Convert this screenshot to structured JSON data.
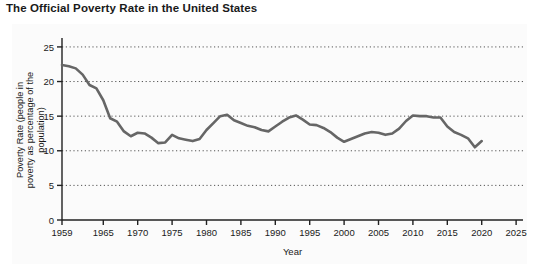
{
  "title": "The Official Poverty Rate in the United States",
  "colors": {
    "line": "#666666",
    "axis": "#222222",
    "grid": "#555555",
    "text": "#1a1a1a",
    "panel": "#fbfbfb",
    "background": "#ffffff"
  },
  "chart_data": {
    "type": "line",
    "title": "The Official Poverty Rate in the United States",
    "xlabel": "Year",
    "ylabel": "Poverty Rate (people in poverty as percentage of the population)",
    "xlim": [
      1959,
      2026
    ],
    "ylim": [
      0,
      26
    ],
    "xticks": [
      1959,
      1965,
      1970,
      1975,
      1980,
      1985,
      1990,
      1995,
      2000,
      2005,
      2010,
      2015,
      2020,
      2025
    ],
    "xtick_labels": [
      "1959",
      "1965",
      "1970",
      "1975",
      "1980",
      "1985",
      "1990",
      "1995",
      "2000",
      "2005",
      "2010",
      "2015",
      "2020",
      "2025"
    ],
    "yticks": [
      0,
      5,
      10,
      15,
      20,
      25
    ],
    "ytick_labels": [
      "0",
      "5",
      "10",
      "15",
      "20",
      "25"
    ],
    "grid": true,
    "grid_style": "dotted",
    "grid_axis": "y",
    "legend": false,
    "series": [
      {
        "name": "Official poverty rate",
        "x": [
          1959,
          1960,
          1961,
          1962,
          1963,
          1964,
          1965,
          1966,
          1967,
          1968,
          1969,
          1970,
          1971,
          1972,
          1973,
          1974,
          1975,
          1976,
          1977,
          1978,
          1979,
          1980,
          1981,
          1982,
          1983,
          1984,
          1985,
          1986,
          1987,
          1988,
          1989,
          1990,
          1991,
          1992,
          1993,
          1994,
          1995,
          1996,
          1997,
          1998,
          1999,
          2000,
          2001,
          2002,
          2003,
          2004,
          2005,
          2006,
          2007,
          2008,
          2009,
          2010,
          2011,
          2012,
          2013,
          2014,
          2015,
          2016,
          2017,
          2018,
          2019,
          2020
        ],
        "values": [
          22.4,
          22.2,
          21.9,
          21.0,
          19.5,
          19.0,
          17.3,
          14.7,
          14.2,
          12.8,
          12.1,
          12.6,
          12.5,
          11.9,
          11.1,
          11.2,
          12.3,
          11.8,
          11.6,
          11.4,
          11.7,
          13.0,
          14.0,
          15.0,
          15.2,
          14.4,
          14.0,
          13.6,
          13.4,
          13.0,
          12.8,
          13.5,
          14.2,
          14.8,
          15.1,
          14.5,
          13.8,
          13.7,
          13.3,
          12.7,
          11.9,
          11.3,
          11.7,
          12.1,
          12.5,
          12.7,
          12.6,
          12.3,
          12.5,
          13.2,
          14.3,
          15.1,
          15.0,
          15.0,
          14.8,
          14.8,
          13.5,
          12.7,
          12.3,
          11.8,
          10.5,
          11.4
        ]
      }
    ]
  }
}
